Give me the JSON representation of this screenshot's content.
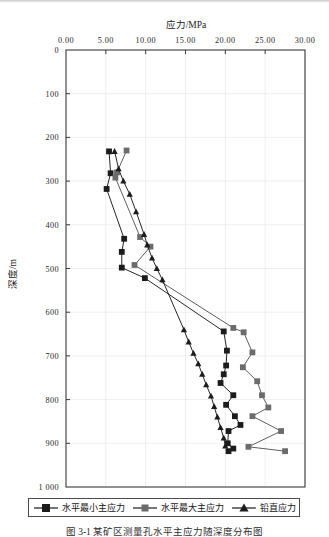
{
  "figure": {
    "caption": "图 3-1  某矿区测量孔水平主应力随深度分布图"
  },
  "legend": {
    "items": [
      {
        "label": "水平最小主应力",
        "marker": "square-dark-icon",
        "color": "#1c1c1c"
      },
      {
        "label": "水平最大主应力",
        "marker": "square-gray-icon",
        "color": "#6b6b6b"
      },
      {
        "label": "铅直应力",
        "marker": "triangle-dark-icon",
        "color": "#1c1c1c"
      }
    ]
  },
  "chart_data": {
    "type": "line",
    "title": "",
    "xlabel": "应力/MPa",
    "ylabel": "深度/m",
    "xlim": [
      0,
      30
    ],
    "ylim": [
      0,
      1000
    ],
    "y_inverted": true,
    "xticks": [
      "0.00",
      "5.00",
      "10.00",
      "15.00",
      "20.00",
      "25.00",
      "30.00"
    ],
    "xtick_values": [
      0,
      5,
      10,
      15,
      20,
      25,
      30
    ],
    "yticks": [
      "0",
      "100",
      "200",
      "300",
      "400",
      "500",
      "600",
      "700",
      "800",
      "900",
      "1 000"
    ],
    "ytick_values": [
      0,
      100,
      200,
      300,
      400,
      500,
      600,
      700,
      800,
      900,
      1000
    ],
    "grid": true,
    "legend_position": "bottom",
    "series": [
      {
        "name": "水平最小主应力",
        "marker": "square",
        "color": "#1c1c1c",
        "points": [
          {
            "stress": 5.4,
            "depth": 232
          },
          {
            "stress": 5.6,
            "depth": 282
          },
          {
            "stress": 5.1,
            "depth": 318
          },
          {
            "stress": 7.3,
            "depth": 432
          },
          {
            "stress": 7.0,
            "depth": 462
          },
          {
            "stress": 7.0,
            "depth": 498
          },
          {
            "stress": 9.9,
            "depth": 522
          },
          {
            "stress": 19.8,
            "depth": 644
          },
          {
            "stress": 20.2,
            "depth": 688
          },
          {
            "stress": 20.1,
            "depth": 722
          },
          {
            "stress": 19.8,
            "depth": 742
          },
          {
            "stress": 19.4,
            "depth": 762
          },
          {
            "stress": 21.0,
            "depth": 790
          },
          {
            "stress": 20.1,
            "depth": 812
          },
          {
            "stress": 21.2,
            "depth": 838
          },
          {
            "stress": 21.9,
            "depth": 858
          },
          {
            "stress": 20.4,
            "depth": 872
          },
          {
            "stress": 20.3,
            "depth": 900
          },
          {
            "stress": 21.0,
            "depth": 912
          },
          {
            "stress": 20.4,
            "depth": 918
          }
        ]
      },
      {
        "name": "水平最大主应力",
        "marker": "square",
        "color": "#6b6b6b",
        "points": [
          {
            "stress": 7.6,
            "depth": 230
          },
          {
            "stress": 6.4,
            "depth": 280
          },
          {
            "stress": 6.2,
            "depth": 292
          },
          {
            "stress": 9.3,
            "depth": 428
          },
          {
            "stress": 10.6,
            "depth": 450
          },
          {
            "stress": 8.6,
            "depth": 492
          },
          {
            "stress": 21.0,
            "depth": 636
          },
          {
            "stress": 22.3,
            "depth": 646
          },
          {
            "stress": 23.4,
            "depth": 692
          },
          {
            "stress": 22.2,
            "depth": 726
          },
          {
            "stress": 24.0,
            "depth": 758
          },
          {
            "stress": 24.6,
            "depth": 790
          },
          {
            "stress": 25.4,
            "depth": 818
          },
          {
            "stress": 23.4,
            "depth": 838
          },
          {
            "stress": 27.0,
            "depth": 872
          },
          {
            "stress": 22.9,
            "depth": 908
          },
          {
            "stress": 27.5,
            "depth": 918
          }
        ]
      },
      {
        "name": "铅直应力",
        "marker": "triangle",
        "color": "#1c1c1c",
        "points": [
          {
            "stress": 6.1,
            "depth": 232
          },
          {
            "stress": 6.6,
            "depth": 272
          },
          {
            "stress": 7.2,
            "depth": 300
          },
          {
            "stress": 8.0,
            "depth": 330
          },
          {
            "stress": 8.8,
            "depth": 370
          },
          {
            "stress": 9.8,
            "depth": 422
          },
          {
            "stress": 10.2,
            "depth": 446
          },
          {
            "stress": 10.8,
            "depth": 476
          },
          {
            "stress": 11.4,
            "depth": 500
          },
          {
            "stress": 12.1,
            "depth": 526
          },
          {
            "stress": 14.8,
            "depth": 640
          },
          {
            "stress": 15.4,
            "depth": 668
          },
          {
            "stress": 16.0,
            "depth": 694
          },
          {
            "stress": 16.6,
            "depth": 718
          },
          {
            "stress": 17.1,
            "depth": 742
          },
          {
            "stress": 17.6,
            "depth": 766
          },
          {
            "stress": 18.2,
            "depth": 792
          },
          {
            "stress": 18.6,
            "depth": 816
          },
          {
            "stress": 19.0,
            "depth": 840
          },
          {
            "stress": 19.4,
            "depth": 864
          },
          {
            "stress": 19.8,
            "depth": 888
          },
          {
            "stress": 20.0,
            "depth": 906
          }
        ]
      }
    ]
  }
}
